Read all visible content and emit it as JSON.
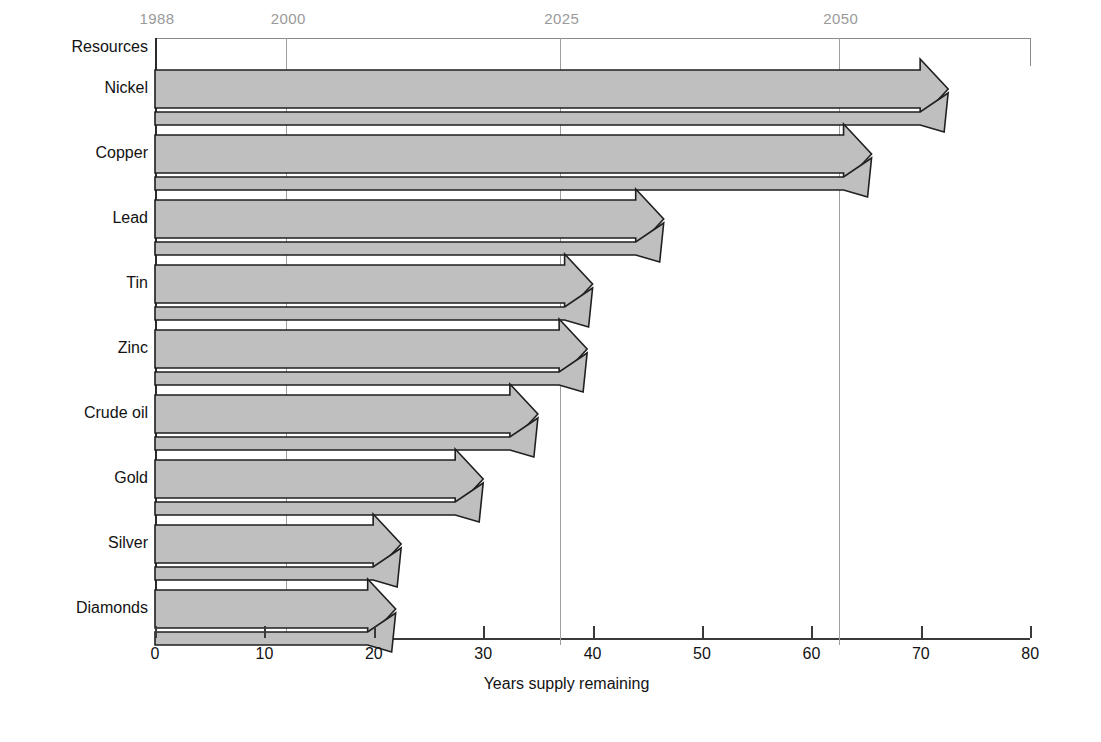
{
  "chart_data": {
    "type": "bar",
    "title": "",
    "xlabel": "Years supply remaining",
    "ylabel": "Resources",
    "xlim": [
      0,
      80
    ],
    "xticks": [
      0,
      10,
      20,
      30,
      40,
      50,
      60,
      70,
      80
    ],
    "xtick_labels": [
      "0",
      "10",
      "20",
      "30",
      "40",
      "50",
      "60",
      "70",
      "80"
    ],
    "grid": true,
    "legend": "none",
    "orientation": "horizontal",
    "bar_style": "arrow",
    "top_axis": {
      "label_kind": "year",
      "ticks": [
        {
          "label": "1988",
          "years_from_start": 0
        },
        {
          "label": "2000",
          "years_from_start": 12
        },
        {
          "label": "2025",
          "years_from_start": 37
        },
        {
          "label": "2050",
          "years_from_start": 62.5
        }
      ]
    },
    "categories": [
      "Nickel",
      "Copper",
      "Lead",
      "Tin",
      "Zinc",
      "Crude oil",
      "Gold",
      "Silver",
      "Diamonds"
    ],
    "values": [
      72.5,
      65.5,
      46.5,
      40,
      39.5,
      35,
      30,
      22.5,
      22
    ],
    "series": [
      {
        "name": "Years supply remaining",
        "values": [
          72.5,
          65.5,
          46.5,
          40,
          39.5,
          35,
          30,
          22.5,
          22
        ]
      }
    ]
  },
  "axis": {
    "y_header": "Resources",
    "x_title": "Years supply remaining"
  },
  "colors": {
    "bar_fill": "#bfbfbf",
    "bar_stroke": "#1f1f1f",
    "gridline": "#9e9e9e",
    "year_label": "#9a9a9a",
    "text": "#121212",
    "background": "#ffffff"
  },
  "top_years": [
    {
      "label": "1988"
    },
    {
      "label": "2000"
    },
    {
      "label": "2025"
    },
    {
      "label": "2050"
    }
  ],
  "rows": [
    {
      "label": "Nickel"
    },
    {
      "label": "Copper"
    },
    {
      "label": "Lead"
    },
    {
      "label": "Tin"
    },
    {
      "label": "Zinc"
    },
    {
      "label": "Crude oil"
    },
    {
      "label": "Gold"
    },
    {
      "label": "Silver"
    },
    {
      "label": "Diamonds"
    }
  ],
  "xticks": [
    {
      "label": "0"
    },
    {
      "label": "10"
    },
    {
      "label": "20"
    },
    {
      "label": "30"
    },
    {
      "label": "40"
    },
    {
      "label": "50"
    },
    {
      "label": "60"
    },
    {
      "label": "70"
    },
    {
      "label": "80"
    }
  ]
}
